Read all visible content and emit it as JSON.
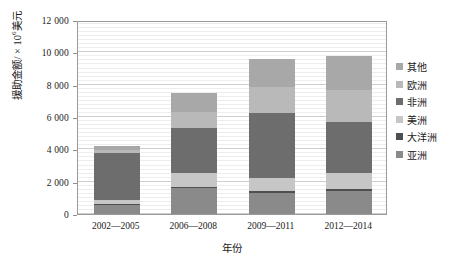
{
  "chart_data": {
    "type": "bar",
    "subtype": "stacked-vertical",
    "title": "",
    "xlabel": "年份",
    "ylabel": "援助金额/×10⁶美元",
    "ylabel_base": "援助金额/ × 10",
    "ylabel_exponent": "6",
    "ylabel_unit": "美元",
    "categories": [
      "2002—2005",
      "2006—2008",
      "2009—2011",
      "2012—2014"
    ],
    "ylim": [
      0,
      12000
    ],
    "ytick_values": [
      0,
      2000,
      4000,
      6000,
      8000,
      10000,
      12000
    ],
    "ytick_labels": [
      "0",
      "2 000",
      "4 000",
      "6 000",
      "8 000",
      "10 000",
      "12 000"
    ],
    "grid": true,
    "legend_position": "right",
    "stack_order_bottom_to_top": [
      "亚洲",
      "大洋洲",
      "美洲",
      "非洲",
      "欧洲",
      "其他"
    ],
    "series": [
      {
        "name": "其他",
        "color": "#a8a8a8",
        "values": [
          290,
          1200,
          1750,
          2100
        ]
      },
      {
        "name": "欧洲",
        "color": "#b9b9b9",
        "values": [
          170,
          1000,
          1600,
          2000
        ]
      },
      {
        "name": "非洲",
        "color": "#6d6d6d",
        "values": [
          2900,
          2750,
          4050,
          3150
        ]
      },
      {
        "name": "美洲",
        "color": "#c6c6c6",
        "values": [
          250,
          870,
          780,
          1000
        ]
      },
      {
        "name": "大洋洲",
        "color": "#4f4f4f",
        "values": [
          60,
          60,
          130,
          110
        ]
      },
      {
        "name": "亚洲",
        "color": "#8a8a8a",
        "values": [
          570,
          1620,
          1300,
          1440
        ]
      }
    ],
    "totals": [
      4240,
      7500,
      9610,
      9800
    ]
  },
  "legend": {
    "items": [
      {
        "label": "其他",
        "color": "#a8a8a8"
      },
      {
        "label": "欧洲",
        "color": "#b9b9b9"
      },
      {
        "label": "非洲",
        "color": "#6d6d6d"
      },
      {
        "label": "美洲",
        "color": "#c6c6c6"
      },
      {
        "label": "大洋洲",
        "color": "#4f4f4f"
      },
      {
        "label": "亚洲",
        "color": "#8a8a8a"
      }
    ]
  },
  "style": {
    "plot_border_color": "#9a9a9a",
    "major_gridline_color": "#cfcfcf",
    "minor_gridline_color": "#ededed",
    "background": "#ffffff",
    "text_color": "#1a1a1a"
  }
}
